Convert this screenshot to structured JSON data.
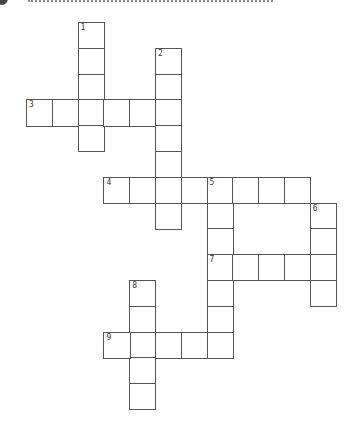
{
  "puzzle": {
    "title_cropped": true,
    "grid": {
      "origin_x": 26,
      "origin_y": 22,
      "cell_size": 25.8,
      "border_color": "#555555",
      "background": "#ffffff"
    },
    "entries": [
      {
        "number": "1",
        "direction": "down",
        "row": 0,
        "col": 2,
        "length": 5
      },
      {
        "number": "2",
        "direction": "down",
        "row": 1,
        "col": 5,
        "length": 7
      },
      {
        "number": "3",
        "direction": "across",
        "row": 3,
        "col": 0,
        "length": 6
      },
      {
        "number": "4",
        "direction": "across",
        "row": 6,
        "col": 3,
        "length": 8
      },
      {
        "number": "5",
        "direction": "down",
        "row": 6,
        "col": 7,
        "length": 7
      },
      {
        "number": "6",
        "direction": "down",
        "row": 7,
        "col": 11,
        "length": 4
      },
      {
        "number": "7",
        "direction": "across",
        "row": 9,
        "col": 7,
        "length": 5
      },
      {
        "number": "8",
        "direction": "down",
        "row": 10,
        "col": 4,
        "length": 5
      },
      {
        "number": "9",
        "direction": "across",
        "row": 12,
        "col": 3,
        "length": 5
      }
    ]
  }
}
